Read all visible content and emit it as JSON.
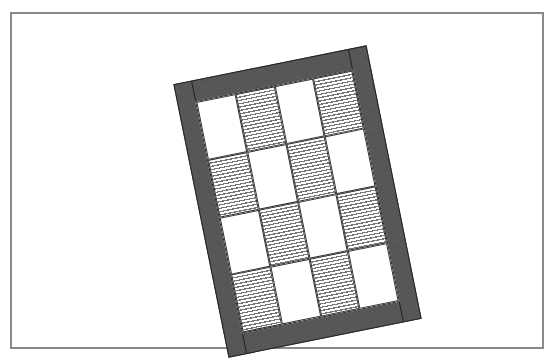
{
  "figure": {
    "frame_color": "#8a8a8a",
    "border_color": "#555555",
    "stripe_color": "#777777",
    "rotation_deg": -11.4,
    "rows": 4,
    "cols": 4,
    "pattern": [
      [
        "white",
        "striped",
        "white",
        "striped"
      ],
      [
        "striped",
        "white",
        "striped",
        "white"
      ],
      [
        "white",
        "striped",
        "white",
        "striped"
      ],
      [
        "striped",
        "white",
        "striped",
        "white"
      ]
    ]
  }
}
